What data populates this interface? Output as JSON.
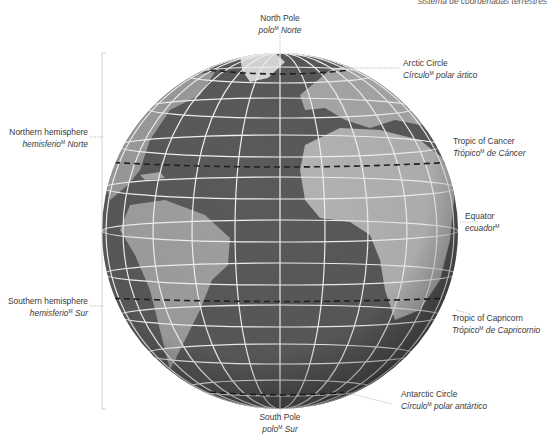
{
  "header": {
    "text": "sistema  de coordenadas  terrestres"
  },
  "labels": {
    "north_pole": {
      "en": "North Pole",
      "es": "polo",
      "es_sup": "M",
      "es_after": " Norte"
    },
    "arctic_circle": {
      "en": "Arctic Circle",
      "es": "Círculo",
      "es_sup": "M",
      "es_after": " polar ártico"
    },
    "northern_hemisphere": {
      "en": "Northern hemisphere",
      "es": "hemisferio",
      "es_sup": "M",
      "es_after": " Norte"
    },
    "tropic_cancer": {
      "en": "Tropic of Cancer",
      "es": "Trópico",
      "es_sup": "M",
      "es_after": " de Cáncer"
    },
    "equator": {
      "en": "Equator",
      "es": "ecuador",
      "es_sup": "M",
      "es_after": ""
    },
    "southern_hemisphere": {
      "en": "Southern hemisphere",
      "es": "hemisferio",
      "es_sup": "M",
      "es_after": " Sur"
    },
    "tropic_capricorn": {
      "en": "Tropic of Capricorn",
      "es": "Trópico",
      "es_sup": "M",
      "es_after": " de Capricornio"
    },
    "antarctic_circle": {
      "en": "Antarctic Circle",
      "es": "Círculo",
      "es_sup": "M",
      "es_after": " polar antártico"
    },
    "south_pole": {
      "en": "South Pole",
      "es": "polo",
      "es_sup": "M",
      "es_after": " Sur"
    }
  },
  "colors": {
    "ocean": "#5a5a5a",
    "land": "#a8a8a8",
    "grid": "#f2f2f2",
    "leader": "#9a9a9a",
    "text": "#3a3a3a"
  }
}
